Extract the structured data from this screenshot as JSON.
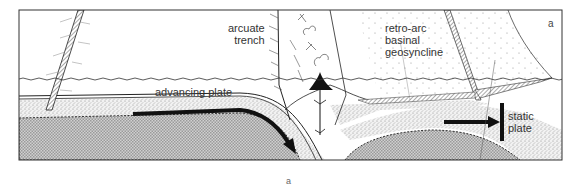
{
  "figure": {
    "panel_letter": "a",
    "caption": "a",
    "colors": {
      "line": "#222222",
      "mantle_fill": "#bdbdbd",
      "stipple_fill": "#e6e6e6",
      "arrow": "#111111",
      "background": "#ffffff"
    }
  },
  "labels": {
    "arcuate_trench": "arcuate\ntrench",
    "retro_arc": "retro-arc\nbasinal\ngeosyncline",
    "advancing_plate": "advancing plate",
    "static_plate": "static\nplate"
  },
  "icons": {
    "volcano": "volcano-icon",
    "subduction_arrow": "arrow-down-right-icon",
    "static_arrow": "arrow-right-icon"
  }
}
